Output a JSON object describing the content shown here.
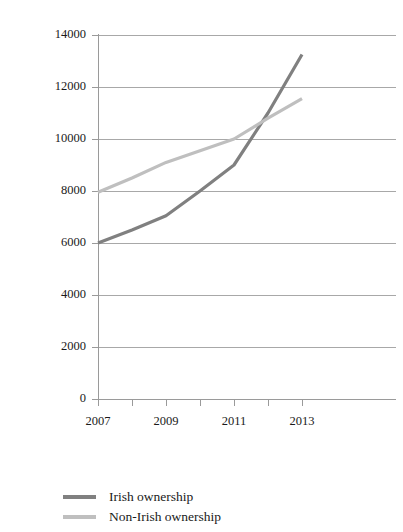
{
  "chart_data": {
    "type": "line",
    "title": "",
    "subtitle": "",
    "xlabel": "",
    "ylabel": "",
    "x": [
      2007,
      2008,
      2009,
      2010,
      2011,
      2012,
      2013
    ],
    "xtick_labels": [
      "2007",
      "2009",
      "2011",
      "2013"
    ],
    "xtick_values": [
      2007,
      2009,
      2011,
      2013
    ],
    "xlim": [
      2007,
      2013
    ],
    "ylim": [
      0,
      14000
    ],
    "ytick_labels": [
      "0",
      "2000",
      "4000",
      "6000",
      "8000",
      "10000",
      "12000",
      "14000"
    ],
    "ytick_values": [
      0,
      2000,
      4000,
      6000,
      8000,
      10000,
      12000,
      14000
    ],
    "grid": "horizontal",
    "legend_position": "bottom-left",
    "series": [
      {
        "name": "Irish ownership",
        "color": "#808080",
        "values": [
          6000,
          6500,
          7050,
          8000,
          9000,
          11000,
          13250
        ]
      },
      {
        "name": "Non-Irish ownership",
        "color": "#bfbfbf",
        "values": [
          7950,
          8500,
          9100,
          9550,
          10000,
          10800,
          11550
        ]
      }
    ]
  },
  "legend": {
    "items": [
      {
        "label": "Irish ownership",
        "color": "#808080"
      },
      {
        "label": "Non-Irish ownership",
        "color": "#bfbfbf"
      }
    ]
  }
}
